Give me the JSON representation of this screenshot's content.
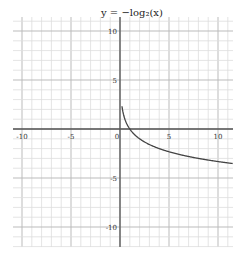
{
  "chart_data": {
    "type": "line",
    "title": "y = −log₂(x)",
    "xlabel": "",
    "ylabel": "",
    "xlim": [
      -11,
      11.5
    ],
    "ylim": [
      -11.8,
      11.3
    ],
    "grid": true,
    "grid_minor_step": 1,
    "grid_major_step": 5,
    "x_ticks": [
      -10,
      -5,
      0,
      5,
      10
    ],
    "y_ticks": [
      10,
      5,
      -5,
      -10
    ],
    "x_tick_labels": [
      "-10",
      "-5",
      "0",
      "5",
      "10"
    ],
    "y_tick_labels": [
      "10",
      "5",
      "-5",
      "-10"
    ],
    "series": [
      {
        "name": "y = −log₂(x)",
        "function": "-log2(x)",
        "x": [
          0.2,
          0.25,
          0.5,
          1,
          2,
          4,
          8,
          11.5
        ],
        "y": [
          2.32,
          2,
          1,
          0,
          -1,
          -2,
          -3,
          -3.52
        ],
        "color": "#444444"
      }
    ]
  },
  "style": {
    "axis_color": "#555555",
    "minor_grid_color": "#dddddd",
    "major_grid_color": "#bbbbbb",
    "curve_color": "#444444"
  }
}
